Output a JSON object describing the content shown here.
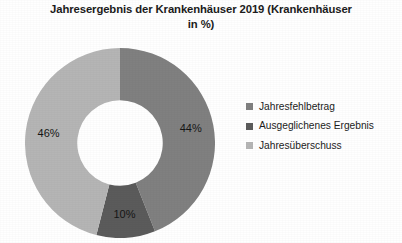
{
  "chart_data": {
    "type": "pie",
    "variant": "doughnut",
    "title": "Jahresergebnis der Krankenhäuser 2019 (Krankenhäuser in %)",
    "title_lines": [
      "Jahresergebnis der Krankenhäuser 2019 (Krankenhäuser",
      "in %)"
    ],
    "xlabel": "",
    "ylabel": "",
    "units": "%",
    "grid": false,
    "legend_position": "right",
    "start_angle_deg": 0,
    "direction": "clockwise",
    "hole_ratio": 0.45,
    "categories": [
      "Jahresfehlbetrag",
      "Ausgeglichenes Ergebnis",
      "Jahresüberschuss"
    ],
    "values": [
      44,
      10,
      46
    ],
    "data_labels": [
      "44%",
      "10%",
      "46%"
    ],
    "colors": [
      "#808080",
      "#5b5b5b",
      "#b5b5b5"
    ],
    "slices": [
      {
        "label": "Jahresfehlbetrag",
        "value": 44,
        "display": "44%",
        "color": "#808080"
      },
      {
        "label": "Ausgeglichenes Ergebnis",
        "value": 10,
        "display": "10%",
        "color": "#5b5b5b"
      },
      {
        "label": "Jahresüberschuss",
        "value": 46,
        "display": "46%",
        "color": "#b5b5b5"
      }
    ]
  },
  "legend": {
    "items": [
      {
        "label": "Jahresfehlbetrag",
        "color": "#808080"
      },
      {
        "label": "Ausgeglichenes Ergebnis",
        "color": "#5b5b5b"
      },
      {
        "label": "Jahresüberschuss",
        "color": "#b5b5b5"
      }
    ]
  }
}
